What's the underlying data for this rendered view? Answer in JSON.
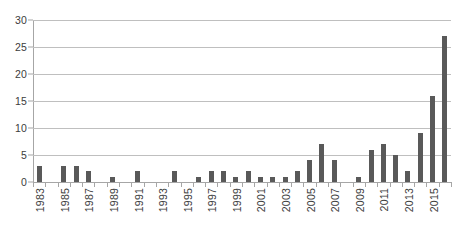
{
  "chart_data": {
    "type": "bar",
    "title": "",
    "subtitle": "",
    "xlabel": "",
    "ylabel": "",
    "ylim": [
      0,
      30
    ],
    "yticks": [
      0,
      5,
      10,
      15,
      20,
      25,
      30
    ],
    "ytick_labels": [
      "0",
      "5",
      "10",
      "15",
      "20",
      "25",
      "30"
    ],
    "grid": true,
    "legend": false,
    "legend_position": "none",
    "bar_color": "#595959",
    "gridline_color": "#bfbfbf",
    "axis_color": "#a6a6a6",
    "tick_label_color": "#3c3c3c",
    "xtick_label_rotation": 90,
    "xtick_label_interval": 2,
    "categories": [
      "1983",
      "1984",
      "1985",
      "1986",
      "1987",
      "1988",
      "1989",
      "1990",
      "1991",
      "1992",
      "1993",
      "1994",
      "1995",
      "1996",
      "1997",
      "1998",
      "1999",
      "2000",
      "2001",
      "2002",
      "2003",
      "2004",
      "2005",
      "2006",
      "2007",
      "2008",
      "2009",
      "2010",
      "2011",
      "2012",
      "2013",
      "2014",
      "2015",
      "2016"
    ],
    "xtick_labels_shown": [
      "1983",
      "1985",
      "1987",
      "1989",
      "1991",
      "1993",
      "1995",
      "1997",
      "1999",
      "2001",
      "2003",
      "2005",
      "2007",
      "2009",
      "2011",
      "2013",
      "2015"
    ],
    "values": [
      3,
      0,
      3,
      3,
      2,
      0,
      1,
      0,
      2,
      0,
      0,
      2,
      0,
      1,
      2,
      2,
      1,
      2,
      1,
      1,
      1,
      2,
      4,
      7,
      4,
      0,
      1,
      6,
      7,
      5,
      2,
      9,
      16,
      27
    ]
  }
}
